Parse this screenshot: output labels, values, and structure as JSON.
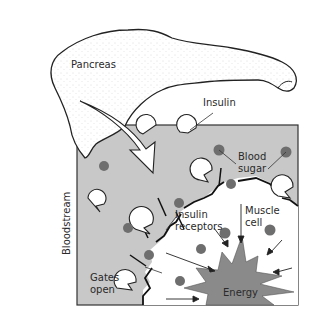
{
  "diagram": {
    "labels": {
      "pancreas": "Pancreas",
      "insulin": "Insulin",
      "blood_sugar_line1": "Blood",
      "blood_sugar_line2": "sugar",
      "bloodstream": "Bloodstream",
      "insulin_receptors_line1": "Insulin",
      "insulin_receptors_line2": "receptors",
      "muscle_cell_line1": "Muscle",
      "muscle_cell_line2": "cell",
      "gates_open_line1": "Gates",
      "gates_open_line2": "open",
      "energy": "Energy"
    },
    "colors": {
      "bloodstream_fill": "#c8c8c8",
      "cell_fill": "#ffffff",
      "sugar_dot": "#6e6e6e",
      "energy_fill": "#8a8a8a",
      "outline": "#222222"
    }
  }
}
